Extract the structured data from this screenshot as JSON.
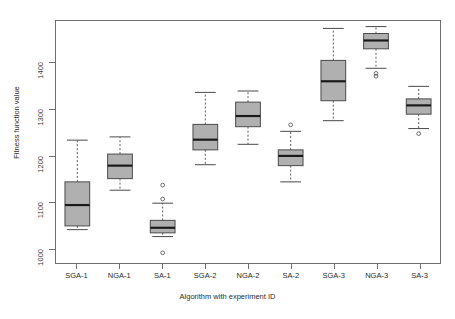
{
  "chart_data": {
    "type": "box",
    "title": "",
    "xlabel": "Algorithm with experiment ID",
    "ylabel": "Fitness function value",
    "categories": [
      "SGA-1",
      "NGA-1",
      "SA-1",
      "SGA-2",
      "NGA-2",
      "SA-2",
      "SGA-3",
      "NGA-3",
      "SA-3"
    ],
    "ylim": [
      968,
      1490
    ],
    "yticks": [
      1000,
      1100,
      1200,
      1300,
      1400
    ],
    "ytick_labels": [
      "1000",
      "1100",
      "1200",
      "1300",
      "1400"
    ],
    "grid": false,
    "legend": null,
    "box_fill": "#b0b0b0",
    "box_stroke": "#4a4a4a",
    "median_color": "#1a1a1a",
    "whisker_style": "dashed",
    "boxes": [
      {
        "name": "SGA-1",
        "whisker_low": 1040,
        "q1": 1048,
        "median": 1093,
        "q3": 1143,
        "whisker_high": 1233,
        "outliers": []
      },
      {
        "name": "NGA-1",
        "whisker_low": 1125,
        "q1": 1150,
        "median": 1178,
        "q3": 1203,
        "whisker_high": 1240,
        "outliers": []
      },
      {
        "name": "SA-1",
        "whisker_low": 1025,
        "q1": 1033,
        "median": 1044,
        "q3": 1060,
        "whisker_high": 1097,
        "outliers": [
          1136,
          1106,
          990
        ]
      },
      {
        "name": "SGA-2",
        "whisker_low": 1180,
        "q1": 1212,
        "median": 1234,
        "q3": 1267,
        "whisker_high": 1336,
        "outliers": []
      },
      {
        "name": "NGA-2",
        "whisker_low": 1224,
        "q1": 1262,
        "median": 1285,
        "q3": 1315,
        "whisker_high": 1339,
        "outliers": []
      },
      {
        "name": "SA-2",
        "whisker_low": 1143,
        "q1": 1178,
        "median": 1199,
        "q3": 1212,
        "whisker_high": 1252,
        "outliers": [
          1266
        ]
      },
      {
        "name": "SGA-3",
        "whisker_low": 1275,
        "q1": 1318,
        "median": 1360,
        "q3": 1405,
        "whisker_high": 1474,
        "outliers": []
      },
      {
        "name": "NGA-3",
        "whisker_low": 1388,
        "q1": 1430,
        "median": 1448,
        "q3": 1463,
        "whisker_high": 1478,
        "outliers": [
          1377,
          1371
        ]
      },
      {
        "name": "SA-3",
        "whisker_low": 1258,
        "q1": 1289,
        "median": 1308,
        "q3": 1322,
        "whisker_high": 1349,
        "outliers": [
          1247
        ]
      }
    ]
  },
  "axes": {
    "y_title": "Fitness function value",
    "x_title": "Algorithm with experiment ID"
  }
}
